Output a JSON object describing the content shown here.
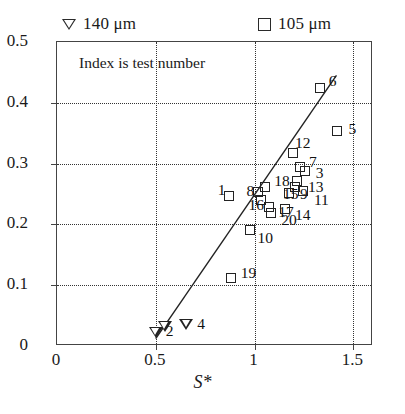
{
  "legend": {
    "items": [
      {
        "marker": "down-triangle-icon",
        "label": "140 μm"
      },
      {
        "marker": "open-square-icon",
        "label": "105 μm"
      }
    ]
  },
  "annotation": {
    "text": "Index is test number"
  },
  "axes": {
    "x_label": "S*",
    "y_label": "",
    "x_ticks": [
      "0",
      "0.5",
      "1",
      "1.5"
    ],
    "y_ticks": [
      "0",
      "0.1",
      "0.2",
      "0.3",
      "0.4",
      "0.5"
    ]
  },
  "chart_data": {
    "type": "scatter",
    "title": "",
    "subtitle": "",
    "xlabel": "S*",
    "ylabel": "",
    "xlim": [
      0,
      1.6
    ],
    "ylim": [
      0,
      0.5
    ],
    "x_ticks": [
      0,
      0.5,
      1,
      1.5
    ],
    "y_ticks": [
      0,
      0.1,
      0.2,
      0.3,
      0.4,
      0.5
    ],
    "grid": "dotted vertical at x ticks and dashed horizontal at y ticks",
    "legend_position": "above plot",
    "annotations": [
      {
        "text": "Index is test number",
        "x": 0.12,
        "y": 0.455
      }
    ],
    "series": [
      {
        "name": "140 μm",
        "marker": "down-triangle",
        "points": [
          {
            "index": "2",
            "x": 0.5,
            "y": 0.02
          },
          {
            "index": "2b",
            "x": 0.545,
            "y": 0.03
          },
          {
            "index": "4",
            "x": 0.655,
            "y": 0.033
          }
        ]
      },
      {
        "name": "105 μm",
        "marker": "open-square",
        "points": [
          {
            "index": "19",
            "x": 0.88,
            "y": 0.112
          },
          {
            "index": "10",
            "x": 0.975,
            "y": 0.19
          },
          {
            "index": "1",
            "x": 0.87,
            "y": 0.247
          },
          {
            "index": "8",
            "x": 1.02,
            "y": 0.253
          },
          {
            "index": "18",
            "x": 1.055,
            "y": 0.262
          },
          {
            "index": "16",
            "x": 1.035,
            "y": 0.24
          },
          {
            "index": "17",
            "x": 1.075,
            "y": 0.228
          },
          {
            "index": "20",
            "x": 1.085,
            "y": 0.218
          },
          {
            "index": "14",
            "x": 1.155,
            "y": 0.225
          },
          {
            "index": "9",
            "x": 1.175,
            "y": 0.252
          },
          {
            "index": "12",
            "x": 1.195,
            "y": 0.318
          },
          {
            "index": "7",
            "x": 1.23,
            "y": 0.295
          },
          {
            "index": "3",
            "x": 1.255,
            "y": 0.288
          },
          {
            "index": "13",
            "x": 1.215,
            "y": 0.272
          },
          {
            "index": "15",
            "x": 1.205,
            "y": 0.262
          },
          {
            "index": "11",
            "x": 1.245,
            "y": 0.255
          },
          {
            "index": "6",
            "x": 1.33,
            "y": 0.425
          },
          {
            "index": "5",
            "x": 1.42,
            "y": 0.353
          }
        ]
      }
    ],
    "fit_line": {
      "type": "linear",
      "x_start": 0.5,
      "y_start": 0.012,
      "x_end": 1.415,
      "y_end": 0.445
    },
    "point_labels": [
      "2",
      "4",
      "19",
      "10",
      "1",
      "8",
      "18",
      "16",
      "17",
      "20",
      "14",
      "9",
      "12",
      "7",
      "3",
      "13",
      "15",
      "11",
      "6",
      "5"
    ]
  }
}
